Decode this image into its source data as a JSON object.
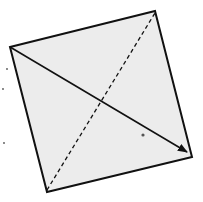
{
  "diagram": {
    "colors": {
      "background": "#ffffff",
      "square_fill": "#ececec",
      "stroke": "#111111",
      "specks": "#555555"
    },
    "square": {
      "corners": [
        [
          10,
          47
        ],
        [
          155,
          11
        ],
        [
          192,
          157
        ],
        [
          47,
          192
        ]
      ]
    },
    "solid_arrow": {
      "from": [
        10,
        47
      ],
      "to": [
        187,
        152
      ],
      "style": "solid",
      "head": "arrow"
    },
    "dashed_diagonal": {
      "from": [
        47,
        190
      ],
      "to": [
        155,
        13
      ],
      "style": "dashed"
    },
    "intersection": [
      104,
      96
    ],
    "specks": [
      [
        7,
        69
      ],
      [
        3,
        89
      ],
      [
        4,
        143
      ],
      [
        143,
        135
      ]
    ]
  }
}
